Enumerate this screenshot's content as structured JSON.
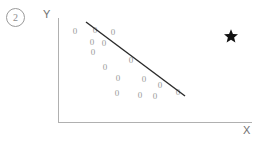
{
  "figure": {
    "badge_label": "2",
    "star_marker": "star-marker",
    "background_color": "#ffffff"
  },
  "axes": {
    "y_label": "Y",
    "x_label": "X",
    "axis_color": "#b0b0b0",
    "y_axis": {
      "x": 58,
      "top": 18,
      "bottom": 123
    },
    "x_axis": {
      "y": 122,
      "left": 58,
      "right": 252
    }
  },
  "annotations": {
    "star": {
      "x": 231,
      "y": 36,
      "color": "#111111",
      "size": 13
    }
  },
  "chart_data": {
    "type": "scatter",
    "title": "",
    "xlabel": "X",
    "ylabel": "Y",
    "marker_glyph": "0",
    "marker_color": "#9b9b9b",
    "grid": false,
    "legend": false,
    "xlim": [
      58,
      252
    ],
    "ylim": [
      122,
      18
    ],
    "points": [
      {
        "x": 75,
        "y": 31
      },
      {
        "x": 95,
        "y": 30
      },
      {
        "x": 113,
        "y": 32
      },
      {
        "x": 92,
        "y": 42
      },
      {
        "x": 104,
        "y": 43
      },
      {
        "x": 93,
        "y": 52
      },
      {
        "x": 105,
        "y": 67
      },
      {
        "x": 131,
        "y": 60
      },
      {
        "x": 118,
        "y": 78
      },
      {
        "x": 144,
        "y": 79
      },
      {
        "x": 160,
        "y": 85
      },
      {
        "x": 117,
        "y": 93
      },
      {
        "x": 140,
        "y": 95
      },
      {
        "x": 155,
        "y": 96
      },
      {
        "x": 178,
        "y": 92
      }
    ],
    "trend_line": {
      "x1": 86,
      "y1": 22,
      "x2": 185,
      "y2": 96,
      "color": "#2b2b2b",
      "width": 1.4,
      "direction": "negative"
    }
  }
}
